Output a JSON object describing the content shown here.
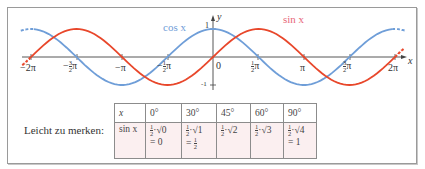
{
  "chart_data": {
    "type": "line",
    "title": "",
    "xlabel": "x",
    "ylabel": "y",
    "xlim": [
      -6.2832,
      6.2832
    ],
    "ylim": [
      -1,
      1
    ],
    "grid": false,
    "x_ticks": [
      "−2π",
      "−3/2 π",
      "−π",
      "−1/2 π",
      "0",
      "1/2 π",
      "π",
      "3/2 π",
      "2π"
    ],
    "y_ticks": [
      "1",
      "-1"
    ],
    "series": [
      {
        "name": "sin x",
        "color": "#e8472b",
        "function": "sin(x)"
      },
      {
        "name": "cos x",
        "color": "#6f9ed8",
        "function": "cos(x)"
      }
    ],
    "legend": [
      {
        "label": "cos x",
        "color": "#6f9ed8",
        "position": "above curve near −1/2 π"
      },
      {
        "label": "sin x",
        "color": "#e8677a",
        "position": "above curve near π/2"
      }
    ]
  },
  "graph": {
    "y_axis_label": "y",
    "x_axis_label": "x",
    "y_tick_top": "1",
    "y_tick_bottom": "-1",
    "origin_label": "0",
    "cos_label": "cos x",
    "sin_label": "sin x",
    "tick_labels": {
      "m2pi": "−2π",
      "m32pi_sign": "−",
      "m32pi_num": "3",
      "m32pi_den": "2",
      "m32pi_pi": "π",
      "mpi": "−π",
      "m12pi_sign": "−",
      "m12pi_num": "1",
      "m12pi_den": "2",
      "m12pi_pi": "π",
      "p12pi_num": "1",
      "p12pi_den": "2",
      "p12pi_pi": "π",
      "ppi": "π",
      "p32pi_num": "3",
      "p32pi_den": "2",
      "p32pi_pi": "π",
      "p2pi": "2π"
    }
  },
  "note": "Leicht zu merken:",
  "table": {
    "header": [
      "x",
      "0°",
      "30°",
      "45°",
      "60°",
      "90°"
    ],
    "row_label": "sin x",
    "cells": [
      {
        "coef_num": "1",
        "coef_den": "2",
        "root": "·√0",
        "result": "= 0"
      },
      {
        "coef_num": "1",
        "coef_den": "2",
        "root": "·√1",
        "result_prefix": "=",
        "result_num": "1",
        "result_den": "2"
      },
      {
        "coef_num": "1",
        "coef_den": "2",
        "root": "·√2"
      },
      {
        "coef_num": "1",
        "coef_den": "2",
        "root": "·√3"
      },
      {
        "coef_num": "1",
        "coef_den": "2",
        "root": "·√4",
        "result": "= 1"
      }
    ]
  }
}
